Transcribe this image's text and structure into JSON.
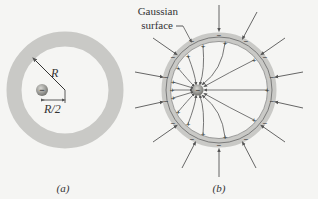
{
  "panel_a": {
    "caption": "(a)",
    "radius_label": "R",
    "offset_label": "R/2",
    "charge_sign": "−"
  },
  "panel_b": {
    "caption": "(b)",
    "gaussian_label_line1": "Gaussian",
    "gaussian_label_line2": "surface",
    "charge_sign": "−"
  },
  "colors": {
    "shell": "#c9c9c6",
    "line": "#555555",
    "charge": "#8a8a86",
    "background": "#f5f5f3"
  }
}
